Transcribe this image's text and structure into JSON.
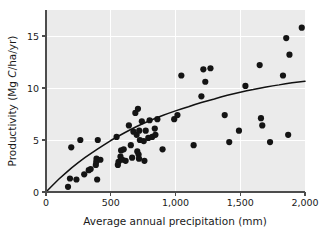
{
  "chart_data": {
    "type": "scatter",
    "title": "",
    "subtitle": "",
    "xlabel": "Average annual precipitation (mm)",
    "ylabel": "Productivity (Mg C/ha/yr)",
    "ylabel_parts": {
      "before": "Productivity (Mg ",
      "italic": "C",
      "after": "/ha/yr)"
    },
    "xlim": [
      0,
      2000
    ],
    "ylim": [
      0,
      17.5
    ],
    "xticks": [
      0,
      500,
      1000,
      1500,
      2000
    ],
    "xtick_labels": [
      "0",
      "500",
      "1,000",
      "1,500",
      "2,000"
    ],
    "yticks": [
      0,
      5,
      10,
      15
    ],
    "ytick_labels": [
      "0",
      "5",
      "10",
      "15"
    ],
    "grid": true,
    "grid_color": "#ffffff",
    "plot_background": "#ebebeb",
    "legend": null,
    "marker_color": "#141414",
    "marker_size": 3.1,
    "curve_color": "#111111",
    "series": [
      {
        "name": "Observations",
        "points": [
          [
            170,
            0.5
          ],
          [
            185,
            1.3
          ],
          [
            195,
            4.3
          ],
          [
            235,
            1.2
          ],
          [
            265,
            5.0
          ],
          [
            295,
            1.7
          ],
          [
            330,
            2.1
          ],
          [
            345,
            2.2
          ],
          [
            385,
            2.6
          ],
          [
            388,
            2.9
          ],
          [
            390,
            3.2
          ],
          [
            395,
            1.2
          ],
          [
            400,
            5.0
          ],
          [
            420,
            3.1
          ],
          [
            545,
            5.3
          ],
          [
            555,
            2.6
          ],
          [
            560,
            2.9
          ],
          [
            575,
            3.4
          ],
          [
            580,
            4.0
          ],
          [
            590,
            3.1
          ],
          [
            600,
            4.1
          ],
          [
            615,
            3.0
          ],
          [
            640,
            6.4
          ],
          [
            655,
            4.5
          ],
          [
            665,
            3.3
          ],
          [
            675,
            5.8
          ],
          [
            690,
            7.6
          ],
          [
            700,
            5.5
          ],
          [
            705,
            3.9
          ],
          [
            710,
            8.0
          ],
          [
            715,
            3.6
          ],
          [
            718,
            3.2
          ],
          [
            720,
            5.9
          ],
          [
            725,
            5.0
          ],
          [
            740,
            6.8
          ],
          [
            755,
            4.9
          ],
          [
            760,
            3.0
          ],
          [
            770,
            5.9
          ],
          [
            790,
            5.2
          ],
          [
            800,
            6.9
          ],
          [
            820,
            5.3
          ],
          [
            840,
            6.1
          ],
          [
            845,
            5.5
          ],
          [
            860,
            7.0
          ],
          [
            900,
            4.1
          ],
          [
            990,
            7.0
          ],
          [
            1015,
            7.4
          ],
          [
            1045,
            11.2
          ],
          [
            1140,
            4.5
          ],
          [
            1200,
            9.2
          ],
          [
            1215,
            11.8
          ],
          [
            1230,
            10.6
          ],
          [
            1270,
            11.9
          ],
          [
            1380,
            7.4
          ],
          [
            1415,
            4.8
          ],
          [
            1490,
            5.9
          ],
          [
            1540,
            10.2
          ],
          [
            1650,
            12.2
          ],
          [
            1660,
            7.1
          ],
          [
            1670,
            6.4
          ],
          [
            1730,
            4.8
          ],
          [
            1830,
            11.2
          ],
          [
            1855,
            14.8
          ],
          [
            1870,
            5.5
          ],
          [
            1880,
            13.2
          ],
          [
            1975,
            15.8
          ]
        ]
      }
    ],
    "fit_curve": {
      "name": "Saturating fit",
      "description": "Increasing, decelerating curve from origin to ~10.6 at 2000 mm",
      "points": [
        [
          0,
          0
        ],
        [
          100,
          1.25
        ],
        [
          200,
          2.35
        ],
        [
          300,
          3.3
        ],
        [
          400,
          4.15
        ],
        [
          500,
          4.95
        ],
        [
          600,
          5.65
        ],
        [
          700,
          6.3
        ],
        [
          800,
          6.85
        ],
        [
          900,
          7.35
        ],
        [
          1000,
          7.8
        ],
        [
          1100,
          8.2
        ],
        [
          1200,
          8.6
        ],
        [
          1300,
          8.95
        ],
        [
          1400,
          9.3
        ],
        [
          1500,
          9.6
        ],
        [
          1600,
          9.85
        ],
        [
          1700,
          10.1
        ],
        [
          1800,
          10.3
        ],
        [
          1900,
          10.5
        ],
        [
          2000,
          10.65
        ]
      ]
    }
  }
}
